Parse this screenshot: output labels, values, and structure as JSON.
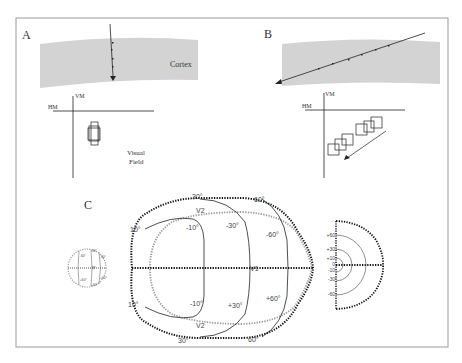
{
  "figure": {
    "panel_a": {
      "label": "A",
      "cortex_label": "Cortex",
      "vm_label": "VM",
      "hm_label": "HM",
      "field_label_line1": "Visual",
      "field_label_line2": "Field"
    },
    "panel_b": {
      "label": "B",
      "vm_label": "VM",
      "hm_label": "HM"
    },
    "panel_c": {
      "label": "C",
      "small_circle": {
        "labels": [
          "-60°",
          "-30°",
          "-10°",
          "M°",
          "+60°",
          "+30°",
          "+10°"
        ]
      },
      "map": {
        "v1_label": "V1",
        "v2_top_label": "V2",
        "v2_bottom_label": "V2",
        "top_labels": [
          "10°",
          "30°",
          "60°"
        ],
        "bottom_labels": [
          "10°",
          "30°",
          "60°"
        ],
        "inner_top_labels": [
          "-10°",
          "-30°",
          "-60°"
        ],
        "inner_bottom_labels": [
          "-10°",
          "+30°",
          "+60°"
        ]
      },
      "half_field": {
        "labels": [
          "+60",
          "+30",
          "+10",
          "0",
          "-10",
          "-30",
          "-60"
        ]
      }
    },
    "colors": {
      "cortex_fill": "#d3d3d3",
      "frame": "#9a9a9a",
      "ink": "#222222",
      "gray_dots": "#999999"
    }
  }
}
